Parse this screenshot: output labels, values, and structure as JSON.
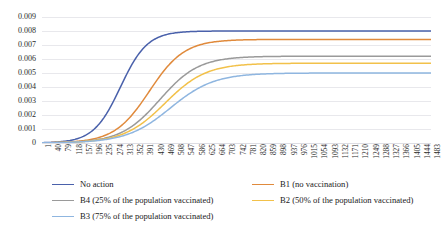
{
  "title": "",
  "chart_data": {
    "type": "line",
    "title": "",
    "xlabel": "",
    "ylabel": "",
    "ylim": [
      0,
      0.009
    ],
    "xlim": [
      1,
      1483
    ],
    "grid": true,
    "legend_position": "bottom",
    "y_ticks": [
      "0.009",
      "0.008",
      "0.007",
      "0.006",
      "0.005",
      "0.004",
      "0.003",
      "0.002",
      "0.001",
      "0"
    ],
    "y_tick_values": [
      0.009,
      0.008,
      0.007,
      0.006,
      0.005,
      0.004,
      0.003,
      0.002,
      0.001,
      0
    ],
    "categories": [
      1,
      40,
      79,
      118,
      157,
      196,
      235,
      274,
      313,
      352,
      391,
      430,
      469,
      508,
      547,
      586,
      625,
      664,
      703,
      742,
      781,
      820,
      859,
      898,
      937,
      976,
      1015,
      1054,
      1093,
      1132,
      1171,
      1210,
      1249,
      1288,
      1327,
      1366,
      1405,
      1444,
      1483
    ],
    "series": [
      {
        "name": "No action",
        "color": "#4a61ab",
        "plateau": 0.008,
        "midpoint": 300,
        "growth": 0.0195,
        "values": [
          1e-05,
          1e-05,
          2e-05,
          3e-05,
          5e-05,
          0.0001,
          0.00021,
          0.00045,
          0.001,
          0.00228,
          0.0046,
          0.0064,
          0.0074,
          0.0078,
          0.00794,
          0.00798,
          0.00799,
          0.008,
          0.008,
          0.008,
          0.008,
          0.008,
          0.008,
          0.008,
          0.008,
          0.008,
          0.008,
          0.008,
          0.008,
          0.008,
          0.008,
          0.008,
          0.008,
          0.008,
          0.008,
          0.008,
          0.008,
          0.008,
          0.008
        ]
      },
      {
        "name": "B1 (no vaccination)",
        "color": "#e08a3c",
        "plateau": 0.0074,
        "midpoint": 410,
        "growth": 0.015,
        "values": [
          5e-06,
          1e-05,
          1e-05,
          2e-05,
          3e-05,
          5e-05,
          9e-05,
          0.00017,
          0.00033,
          0.00066,
          0.0013,
          0.0025,
          0.0043,
          0.006,
          0.0069,
          0.00725,
          0.00736,
          0.00739,
          0.0074,
          0.0074,
          0.0074,
          0.0074,
          0.0074,
          0.0074,
          0.0074,
          0.0074,
          0.0074,
          0.0074,
          0.0074,
          0.0074,
          0.0074,
          0.0074,
          0.0074,
          0.0074,
          0.0074,
          0.0074,
          0.0074,
          0.0074,
          0.0074
        ]
      },
      {
        "name": "B4 (25% of the population vaccinated)",
        "color": "#9a9a9a",
        "plateau": 0.0062,
        "midpoint": 450,
        "growth": 0.0135,
        "values": [
          4e-06,
          7e-06,
          1e-05,
          2e-05,
          3e-05,
          5e-05,
          8e-05,
          0.00015,
          0.00028,
          0.00054,
          0.00102,
          0.0019,
          0.0033,
          0.0048,
          0.0057,
          0.00606,
          0.00617,
          0.0062,
          0.0062,
          0.0062,
          0.0062,
          0.0062,
          0.0062,
          0.0062,
          0.0062,
          0.0062,
          0.0062,
          0.0062,
          0.0062,
          0.0062,
          0.0062,
          0.0062,
          0.0062,
          0.0062,
          0.0062,
          0.0062,
          0.0062,
          0.0062,
          0.0062
        ]
      },
      {
        "name": "B2 (50% of the population vaccinated)",
        "color": "#f2c14a",
        "plateau": 0.0057,
        "midpoint": 470,
        "growth": 0.0128,
        "values": [
          4e-06,
          6e-06,
          1e-05,
          2e-05,
          3e-05,
          4e-05,
          7e-05,
          0.00013,
          0.00024,
          0.00046,
          0.00086,
          0.0016,
          0.0028,
          0.0042,
          0.0052,
          0.00558,
          0.00568,
          0.0057,
          0.0057,
          0.0057,
          0.0057,
          0.0057,
          0.0057,
          0.0057,
          0.0057,
          0.0057,
          0.0057,
          0.0057,
          0.0057,
          0.0057,
          0.0057,
          0.0057,
          0.0057,
          0.0057,
          0.0057,
          0.0057,
          0.0057,
          0.0057,
          0.0057
        ]
      },
      {
        "name": "B3 (75% of the population vaccinated)",
        "color": "#8fb6e0",
        "plateau": 0.005,
        "midpoint": 490,
        "growth": 0.012,
        "values": [
          3e-06,
          5e-06,
          1e-05,
          1e-05,
          2e-05,
          4e-05,
          6e-05,
          0.00011,
          0.00021,
          0.00039,
          0.00073,
          0.00135,
          0.00235,
          0.0036,
          0.0045,
          0.00488,
          0.00498,
          0.005,
          0.005,
          0.005,
          0.005,
          0.005,
          0.005,
          0.005,
          0.005,
          0.005,
          0.005,
          0.005,
          0.005,
          0.005,
          0.005,
          0.005,
          0.005,
          0.005,
          0.005,
          0.005,
          0.005,
          0.005,
          0.005
        ]
      }
    ]
  },
  "legend": {
    "items": [
      {
        "label": "No action",
        "color": "#4a61ab",
        "col": 0,
        "row": 0
      },
      {
        "label": "B1 (no vaccination)",
        "color": "#e08a3c",
        "col": 1,
        "row": 0
      },
      {
        "label": "B4 (25% of the population vaccinated)",
        "color": "#9a9a9a",
        "col": 0,
        "row": 1
      },
      {
        "label": "B2 (50% of the population vaccinated)",
        "color": "#f2c14a",
        "col": 1,
        "row": 1
      },
      {
        "label": "B3 (75% of the population vaccinated)",
        "color": "#8fb6e0",
        "col": 0,
        "row": 2
      }
    ]
  }
}
